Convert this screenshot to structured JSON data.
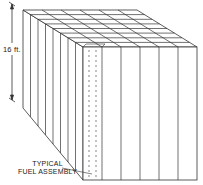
{
  "figure": {
    "type": "isometric-diagram",
    "height_dimension": {
      "label": "16 ft."
    },
    "callout": {
      "line1": "TYPICAL",
      "line2": "FUEL ASSEMBLY"
    },
    "grid": {
      "front_columns": 6,
      "depth_columns": 8
    },
    "colors": {
      "line": "#333333",
      "background": "#ffffff"
    }
  }
}
